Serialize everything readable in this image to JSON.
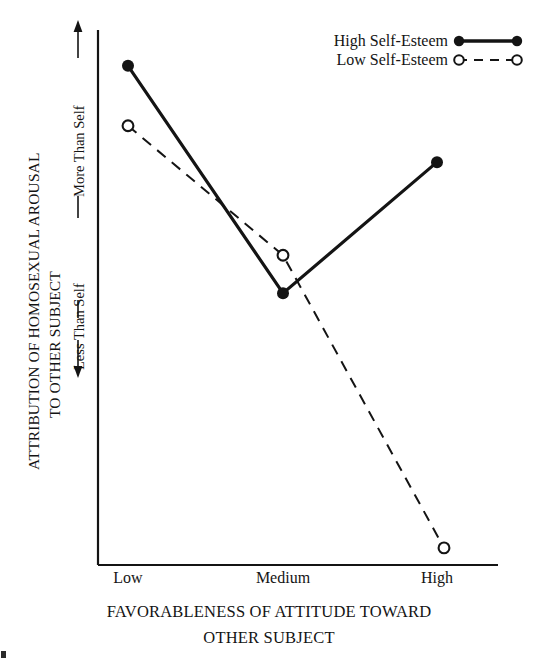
{
  "figure": {
    "background_color": "#ffffff",
    "ink_color": "#141414"
  },
  "axes": {
    "y_label_line1": "ATTRIBUTION OF HOMOSEXUAL AROUSAL",
    "y_label_line2": "TO OTHER SUBJECT",
    "y_direction_high": "More Than Self",
    "y_direction_low": "Less Than Self",
    "x_label_line1": "FAVORABLENESS OF ATTITUDE TOWARD",
    "x_label_line2": "OTHER SUBJECT"
  },
  "legend": {
    "entries": [
      {
        "label": "High Self-Esteem",
        "style": "solid",
        "marker": "filled-circle"
      },
      {
        "label": "Low Self-Esteem",
        "style": "dashed",
        "marker": "open-circle"
      }
    ]
  },
  "chart_data": {
    "type": "line",
    "title": "",
    "subtitle": "",
    "xlabel": "FAVORABLENESS OF ATTITUDE TOWARD OTHER SUBJECT",
    "ylabel": "ATTRIBUTION OF HOMOSEXUAL AROUSAL TO OTHER SUBJECT",
    "categories": [
      "Low",
      "Medium",
      "High"
    ],
    "ylim": [
      0,
      100
    ],
    "y_axis_ticks_shown": false,
    "y_axis_annotations": [
      "Less Than Self",
      "More Than Self"
    ],
    "grid": false,
    "legend_position": "top-right",
    "series": [
      {
        "name": "High Self-Esteem",
        "values": [
          93.3,
          50.8,
          75.3
        ],
        "line_style": "solid",
        "marker": "filled-circle",
        "color": "#141414"
      },
      {
        "name": "Low Self-Esteem",
        "values": [
          82.1,
          57.9,
          3.2
        ],
        "line_style": "dashed",
        "marker": "open-circle",
        "color": "#141414"
      }
    ]
  }
}
